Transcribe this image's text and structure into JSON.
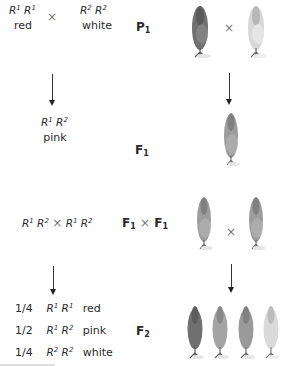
{
  "rows": {
    "p1": {
      "generation_label": "P",
      "generation_sub": "1",
      "parent_left": {
        "allele_a": "R",
        "sup_a": "1",
        "allele_b": "R",
        "sup_b": "1",
        "phenotype": "red"
      },
      "cross_symbol": "×",
      "parent_right": {
        "allele_a": "R",
        "sup_a": "2",
        "allele_b": "R",
        "sup_b": "2",
        "phenotype": "white"
      },
      "plants": [
        {
          "color": "red",
          "shade": "#6e6e6e"
        },
        {
          "color": "white",
          "shade": "#d4d4d4"
        }
      ]
    },
    "f1": {
      "generation_label": "F",
      "generation_sub": "1",
      "genotype": {
        "allele_a": "R",
        "sup_a": "1",
        "allele_b": "R",
        "sup_b": "2"
      },
      "phenotype": "pink",
      "plants": [
        {
          "color": "pink",
          "shade": "#9a9a9a"
        }
      ]
    },
    "f1xf1": {
      "generation_label_left": "F",
      "generation_sub_left": "1",
      "cross_symbol": "×",
      "generation_label_right": "F",
      "generation_sub_right": "1",
      "genotype_left": {
        "allele_a": "R",
        "sup_a": "1",
        "allele_b": "R",
        "sup_b": "2"
      },
      "genotype_right": {
        "allele_a": "R",
        "sup_a": "1",
        "allele_b": "R",
        "sup_b": "2"
      },
      "plants": [
        {
          "color": "pink",
          "shade": "#9a9a9a"
        },
        {
          "color": "pink",
          "shade": "#9a9a9a"
        }
      ]
    },
    "f2": {
      "generation_label": "F",
      "generation_sub": "2",
      "ratios": [
        {
          "fraction": "1/4",
          "allele_a": "R",
          "sup_a": "1",
          "allele_b": "R",
          "sup_b": "1",
          "phenotype": "red"
        },
        {
          "fraction": "1/2",
          "allele_a": "R",
          "sup_a": "1",
          "allele_b": "R",
          "sup_b": "2",
          "phenotype": "pink"
        },
        {
          "fraction": "1/4",
          "allele_a": "R",
          "sup_a": "2",
          "allele_b": "R",
          "sup_b": "2",
          "phenotype": "white"
        }
      ],
      "plants": [
        {
          "color": "red",
          "shade": "#6e6e6e"
        },
        {
          "color": "pink",
          "shade": "#9a9a9a"
        },
        {
          "color": "pink",
          "shade": "#9a9a9a"
        },
        {
          "color": "white",
          "shade": "#d4d4d4"
        }
      ]
    }
  }
}
